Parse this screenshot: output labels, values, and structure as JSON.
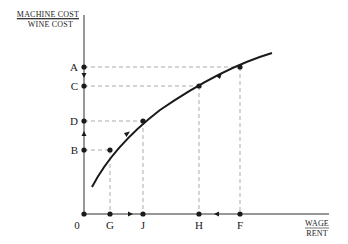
{
  "diagram": {
    "y_axis_title": {
      "numerator": "MACHINE COST",
      "denominator": "WINE COST"
    },
    "x_axis_title": {
      "numerator": "WAGE",
      "denominator": "RENT"
    },
    "origin_label": "0",
    "y_points": [
      {
        "label": "A",
        "y": 67
      },
      {
        "label": "C",
        "y": 86
      },
      {
        "label": "D",
        "y": 121
      },
      {
        "label": "B",
        "y": 150
      }
    ],
    "x_points": [
      {
        "label": "G",
        "x": 110
      },
      {
        "label": "J",
        "x": 143
      },
      {
        "label": "H",
        "x": 199
      },
      {
        "label": "F",
        "x": 240
      }
    ],
    "curve_points": [
      {
        "pair": "G-B",
        "x": 110,
        "y": 150
      },
      {
        "pair": "J-D",
        "x": 143,
        "y": 121
      },
      {
        "pair": "H-C",
        "x": 199,
        "y": 86
      },
      {
        "pair": "F-A",
        "x": 240,
        "y": 67
      }
    ],
    "arrows": [
      {
        "from": "A",
        "to": "C",
        "axis": "y",
        "direction": "down"
      },
      {
        "from": "B",
        "to": "D",
        "axis": "y",
        "direction": "up"
      },
      {
        "from": "G",
        "to": "J",
        "axis": "x",
        "direction": "right"
      },
      {
        "from": "F",
        "to": "H",
        "axis": "x",
        "direction": "left"
      },
      {
        "from": "G-B",
        "to": "J-D",
        "axis": "curve",
        "direction": "up-right"
      },
      {
        "from": "F-A",
        "to": "H-C",
        "axis": "curve",
        "direction": "down-left"
      }
    ],
    "colors": {
      "ink": "#1a1a1a",
      "guide": "#888888"
    }
  }
}
